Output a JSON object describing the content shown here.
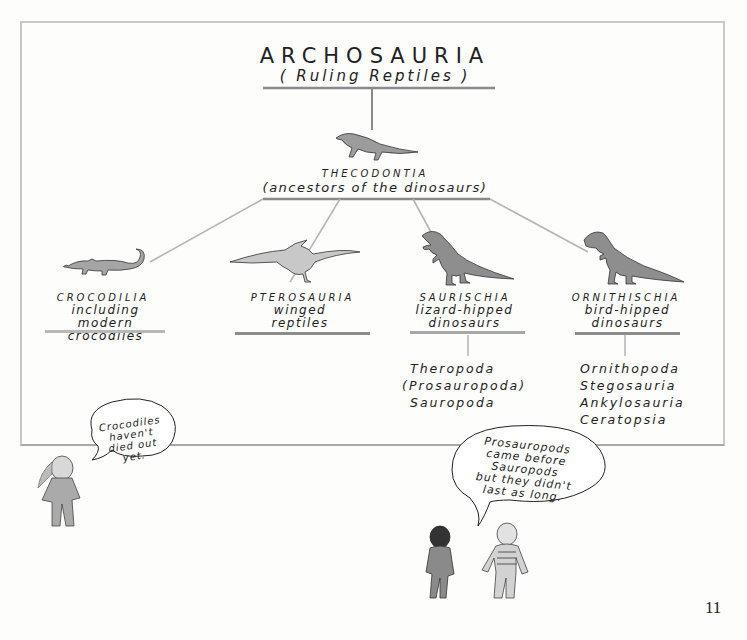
{
  "diagram": {
    "type": "taxonomy-tree",
    "root": {
      "name": "ARCHOSAURIA",
      "subtitle": "( Ruling Reptiles )"
    },
    "ancestor": {
      "name": "THECODONTIA",
      "description": "(ancestors of the dinosaurs)",
      "icon": "thecodont-icon"
    },
    "children": [
      {
        "name": "CROCODILIA",
        "description_line1": "including",
        "description_line2": "modern crocodiles",
        "icon": "crocodile-icon",
        "subgroups": []
      },
      {
        "name": "PTEROSAURIA",
        "description_line1": "winged",
        "description_line2": "reptiles",
        "icon": "pterosaur-icon",
        "subgroups": []
      },
      {
        "name": "SAURISCHIA",
        "description_line1": "lizard-hipped",
        "description_line2": "dinosaurs",
        "icon": "tyrannosaur-icon",
        "subgroups": [
          "Theropoda",
          "(Prosauropoda)",
          "Sauropoda"
        ]
      },
      {
        "name": "ORNITHISCHIA",
        "description_line1": "bird-hipped",
        "description_line2": "dinosaurs",
        "icon": "iguanodon-icon",
        "subgroups": [
          "Ornithopoda",
          "Stegosauria",
          "Ankylosauria",
          "Ceratopsia"
        ]
      }
    ]
  },
  "speech_bubbles": [
    {
      "speaker": "child-left",
      "lines": [
        "Crocodiles",
        "haven't",
        "died out",
        "yet."
      ]
    },
    {
      "speaker": "child-right",
      "lines": [
        "Prosauropods",
        "came before",
        "Sauropods",
        "but they didn't",
        "last as long."
      ]
    }
  ],
  "page_number": "11",
  "colors": {
    "background": "#fdfdfc",
    "frame": "#c9c9c9",
    "lines": "#8c8c8c",
    "ink": "#1f1f1f",
    "animal_fill": "#9a9a9a"
  }
}
